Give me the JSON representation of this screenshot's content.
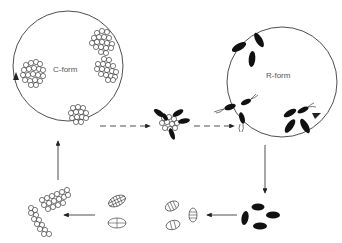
{
  "diagram": {
    "type": "life-cycle",
    "colors": {
      "stroke": "#222222",
      "fill_dark": "#111111",
      "label": "#555555",
      "background": "#ffffff"
    },
    "stages": [
      {
        "id": "c-form",
        "label": "C-form",
        "description": "circle containing clusters of coccoid cells"
      },
      {
        "id": "transition",
        "label": "",
        "description": "cluster of cocci with emerging rods"
      },
      {
        "id": "r-form",
        "label": "R-form",
        "description": "circle containing rod-shaped flagellated cells"
      },
      {
        "id": "dark-spores",
        "label": "",
        "description": "dark oval cells"
      },
      {
        "id": "segmented-spores",
        "label": "",
        "description": "oval cells with internal divisions"
      },
      {
        "id": "chains",
        "label": "",
        "description": "chains of coccoid cells"
      }
    ],
    "arrows": [
      {
        "from": "c-form",
        "to": "transition",
        "style": "dashed"
      },
      {
        "from": "transition",
        "to": "r-form",
        "style": "dashed"
      },
      {
        "from": "r-form",
        "to": "dark-spores",
        "style": "solid"
      },
      {
        "from": "dark-spores",
        "to": "segmented-spores",
        "style": "solid"
      },
      {
        "from": "segmented-spores",
        "to": "chains",
        "style": "solid"
      },
      {
        "from": "chains",
        "to": "c-form",
        "style": "solid"
      }
    ]
  }
}
